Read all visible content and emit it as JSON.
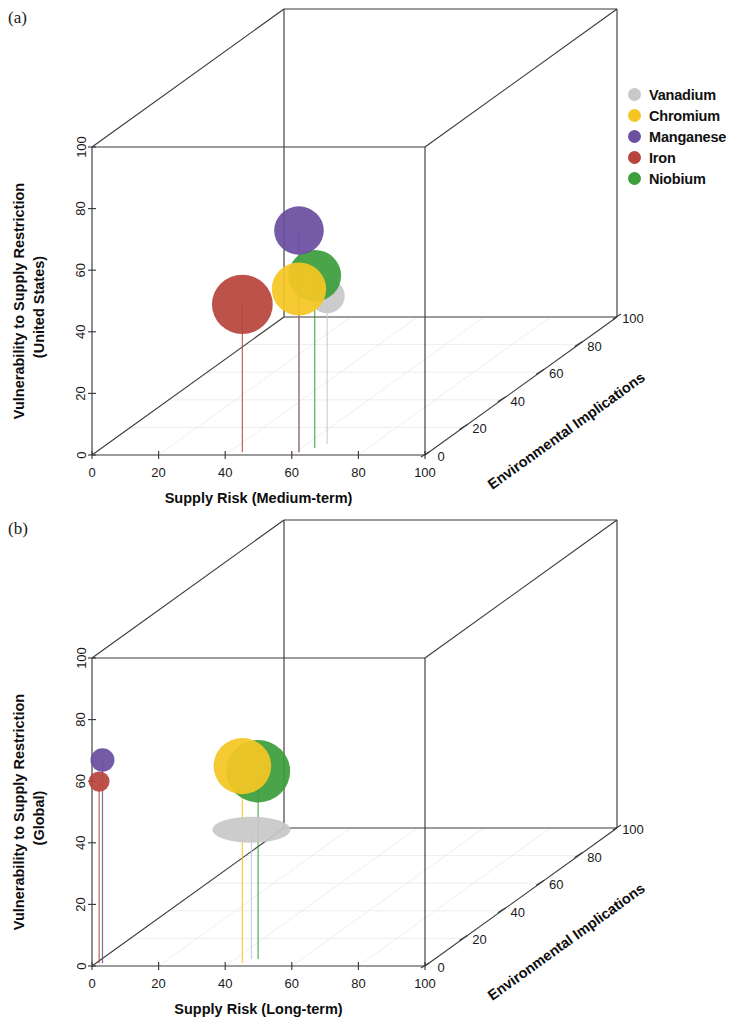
{
  "figure": {
    "panels": [
      {
        "id": "a",
        "label": "(a)",
        "xlabel": "Supply Risk (Medium-term)",
        "ylabel_line1": "Vulnerability to Supply Restriction",
        "ylabel_line2": "(United States)",
        "zlabel": "Environmental Implications",
        "ticks": [
          "0",
          "20",
          "40",
          "60",
          "80",
          "100"
        ]
      },
      {
        "id": "b",
        "label": "(b)",
        "xlabel": "Supply Risk (Long-term)",
        "ylabel_line1": "Vulnerability to Supply Restriction",
        "ylabel_line2": "(Global)",
        "zlabel": "Environmental Implications",
        "ticks": [
          "0",
          "20",
          "40",
          "60",
          "80",
          "100"
        ]
      }
    ]
  },
  "legend": {
    "entries": [
      {
        "label": "Vanadium",
        "color": "#c8c8c8"
      },
      {
        "label": "Chromium",
        "color": "#f5c623"
      },
      {
        "label": "Manganese",
        "color": "#6b4fa0"
      },
      {
        "label": "Iron",
        "color": "#b8453c"
      },
      {
        "label": "Niobium",
        "color": "#3c9e3c"
      }
    ]
  },
  "chart_data": [
    {
      "type": "scatter",
      "panel": "a",
      "title": "",
      "xlabel": "Supply Risk (Medium-term)",
      "ylabel": "Vulnerability to Supply Restriction (United States)",
      "zlabel": "Environmental Implications",
      "xlim": [
        0,
        100
      ],
      "ylim": [
        0,
        100
      ],
      "zlim": [
        0,
        100
      ],
      "xticks": [
        0,
        20,
        40,
        60,
        80,
        100
      ],
      "yticks": [
        0,
        20,
        40,
        60,
        80,
        100
      ],
      "zticks": [
        0,
        20,
        40,
        60,
        80,
        100
      ],
      "grid": true,
      "legend_position": "right",
      "series": [
        {
          "name": "Vanadium",
          "color": "#c8c8c8",
          "x": 66,
          "y": 48,
          "z": 8,
          "size": 22
        },
        {
          "name": "Chromium",
          "color": "#f5c623",
          "x": 61,
          "y": 53,
          "z": 2,
          "size": 34
        },
        {
          "name": "Manganese",
          "color": "#6b4fa0",
          "x": 61,
          "y": 72,
          "z": 2,
          "size": 31
        },
        {
          "name": "Iron",
          "color": "#b8453c",
          "x": 44,
          "y": 48,
          "z": 2,
          "size": 38
        },
        {
          "name": "Niobium",
          "color": "#3c9e3c",
          "x": 64,
          "y": 56,
          "z": 5,
          "size": 33
        }
      ]
    },
    {
      "type": "scatter",
      "panel": "b",
      "title": "",
      "xlabel": "Supply Risk (Long-term)",
      "ylabel": "Vulnerability to Supply Restriction (Global)",
      "zlabel": "Environmental Implications",
      "xlim": [
        0,
        100
      ],
      "ylim": [
        0,
        100
      ],
      "zlim": [
        0,
        100
      ],
      "xticks": [
        0,
        20,
        40,
        60,
        80,
        100
      ],
      "yticks": [
        0,
        20,
        40,
        60,
        80,
        100
      ],
      "zticks": [
        0,
        20,
        40,
        60,
        80,
        100
      ],
      "grid": true,
      "legend_position": "right",
      "series": [
        {
          "name": "Vanadium",
          "color": "#c8c8c8",
          "x": 45,
          "y": 42,
          "z": 5,
          "size": 34
        },
        {
          "name": "Chromium",
          "color": "#f5c623",
          "x": 44,
          "y": 64,
          "z": 2,
          "size": 36
        },
        {
          "name": "Manganese",
          "color": "#6b4fa0",
          "x": 2,
          "y": 66,
          "z": 2,
          "size": 15
        },
        {
          "name": "Iron",
          "color": "#b8453c",
          "x": 1,
          "y": 59,
          "z": 2,
          "size": 13
        },
        {
          "name": "Niobium",
          "color": "#3c9e3c",
          "x": 47,
          "y": 61,
          "z": 5,
          "size": 40
        }
      ]
    }
  ]
}
